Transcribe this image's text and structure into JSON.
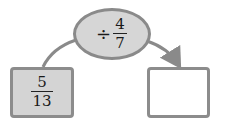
{
  "diagram": {
    "operator_node": {
      "operator": "÷",
      "numerator": "4",
      "denominator": "7"
    },
    "input_box": {
      "numerator": "5",
      "denominator": "13"
    },
    "output_box": {
      "value": ""
    },
    "colors": {
      "node_fill": "#d6d6d6",
      "border": "#8a8a8a",
      "output_fill": "#ffffff"
    }
  }
}
